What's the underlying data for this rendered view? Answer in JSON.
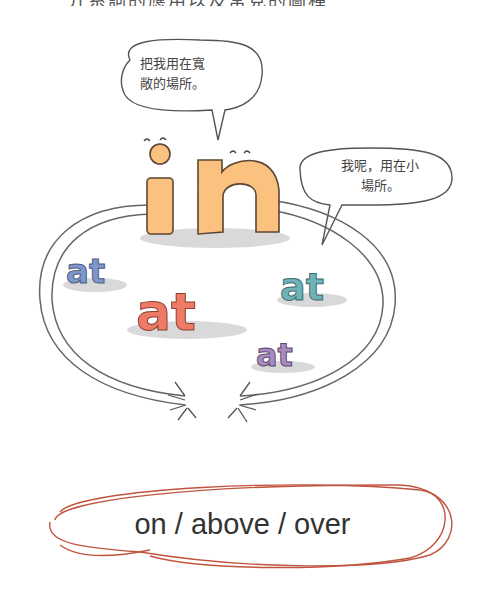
{
  "heading": {
    "text": "介系詞的應用以及常見的圖種",
    "note": "partially cropped at top edge"
  },
  "illustration": {
    "big_word": "in",
    "small_words": [
      "at",
      "at",
      "at",
      "at"
    ],
    "speech_bubbles": [
      {
        "id": "in-bubble",
        "lines": [
          "把我用在寬",
          "敞的場所。"
        ]
      },
      {
        "id": "at-bubble",
        "lines": [
          "我呢，用在小",
          "場所。"
        ]
      }
    ],
    "colors": {
      "in": "#fbc27f",
      "at_blue": "#7f97cc",
      "at_red": "#ef7a66",
      "at_teal": "#6fb3b8",
      "at_purple": "#a98bbf",
      "shadow": "#d9d9d9",
      "outline": "#333333"
    }
  },
  "phrase": {
    "text": "on / above / over",
    "circle_color": "#c0553f"
  }
}
